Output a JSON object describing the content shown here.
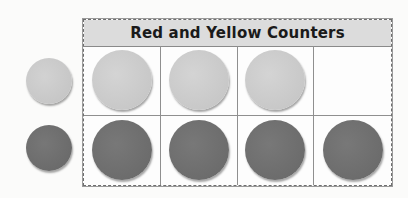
{
  "title": "Red and Yellow Counters",
  "colors": {
    "yellow_counter": "#c9c9c9",
    "red_counter": "#6f6f6f",
    "header_bg": "#dcdcdc"
  },
  "legend": [
    {
      "type": "yellow",
      "label": "yellow counter"
    },
    {
      "type": "red",
      "label": "red counter"
    }
  ],
  "rows": [
    {
      "type": "yellow",
      "cells": [
        true,
        true,
        true,
        false
      ]
    },
    {
      "type": "red",
      "cells": [
        true,
        true,
        true,
        true
      ]
    }
  ],
  "counts": {
    "yellow": 3,
    "red": 4,
    "total_cells": 8
  }
}
